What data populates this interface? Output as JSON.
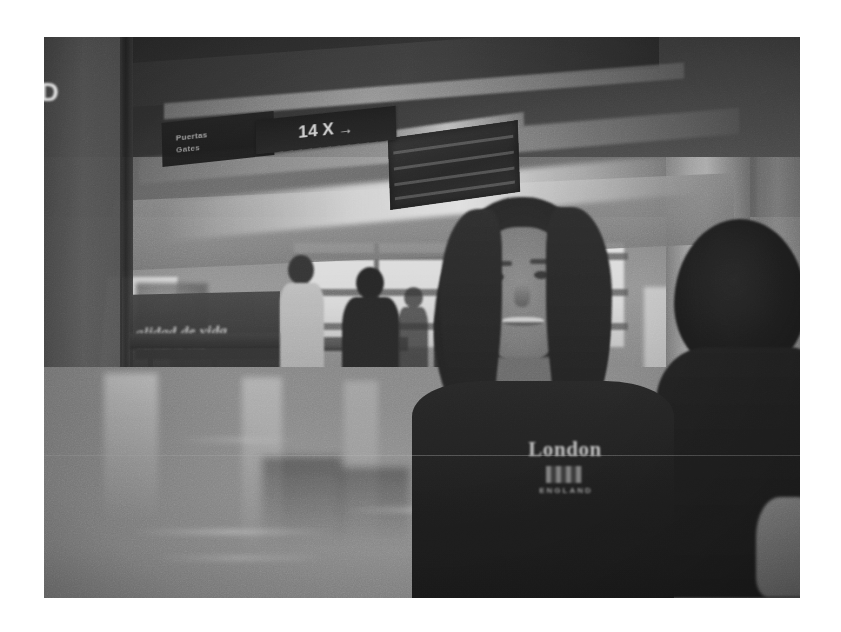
{
  "page": {
    "background_color": "#ffffff",
    "width": 841,
    "height": 632
  },
  "photograph": {
    "alt": "Grayscale photograph of an airport terminal interior with a smiling woman in the foreground",
    "frame": {
      "left": 44,
      "top": 37,
      "width": 756,
      "height": 561
    },
    "color_mode": "grayscale",
    "tone": {
      "darkest": "#0b0b0b",
      "shadow": "#1b1b1b",
      "midtone": "#8c8c8c",
      "highlight": "#f2f2f2",
      "paper_white": "#ffffff"
    },
    "signage": {
      "gate_sign": {
        "number": "14",
        "separator": "X",
        "arrow": "→"
      },
      "destination_sign": {
        "line1": "Puertas",
        "line2": "Gates"
      },
      "edge_glyph": "D",
      "advertisement": {
        "headline": "alidad de vida",
        "subline": "CALIDAD DE VIDA"
      }
    },
    "subject": {
      "shirt_text": "London",
      "shirt_emblem": "union-flag",
      "shirt_subtext": "ENGLAND"
    },
    "scene": {
      "location_type": "airport terminal concourse",
      "elements": [
        "overhead gate signage",
        "ceiling mounted unit",
        "bright exterior windows",
        "concrete pillars",
        "advertising banner",
        "waiting benches",
        "polished reflective floor",
        "silhouetted travelers with luggage"
      ],
      "background_people_count": 4
    },
    "artifacts": {
      "scanline_y": 418,
      "grain": "heavy film grain",
      "blur": "soft focus background"
    }
  }
}
